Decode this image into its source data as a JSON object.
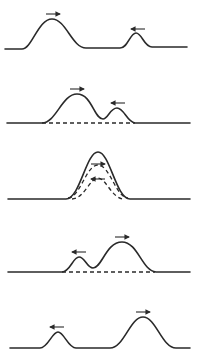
{
  "diagram": {
    "type": "wave-pulse-superposition",
    "colors": {
      "stroke": "#2a2a2a",
      "background": "#ffffff"
    },
    "panels": [
      {
        "name": "before-overlap",
        "baseline_y": 49,
        "pulses": [
          {
            "center_x": 52,
            "peak_y": 19,
            "half_width": 26,
            "direction": "right",
            "arrow_y": 14
          },
          {
            "center_x": 136,
            "peak_y": 33,
            "half_width": 15,
            "direction": "left",
            "arrow_y": 29
          }
        ],
        "dashed_components": false
      },
      {
        "name": "beginning-overlap",
        "baseline_y": 123,
        "pulses": [
          {
            "center_x": 77,
            "peak_y": 94,
            "direction": "right",
            "arrow_y": 89
          },
          {
            "center_x": 117,
            "peak_y": 108,
            "direction": "left",
            "arrow_y": 103
          }
        ],
        "dashed_components": true
      },
      {
        "name": "full-overlap",
        "baseline_y": 199,
        "pulses": [
          {
            "center_x": 98,
            "peak_y": 152,
            "direction": "none"
          }
        ],
        "components": [
          {
            "peak_y": 165,
            "direction": "right",
            "arrow_y": 164
          },
          {
            "peak_y": 178,
            "direction": "left",
            "arrow_y": 179
          }
        ],
        "dashed_components": true
      },
      {
        "name": "separating",
        "baseline_y": 272,
        "pulses": [
          {
            "center_x": 79,
            "peak_y": 257,
            "direction": "left",
            "arrow_y": 252
          },
          {
            "center_x": 122,
            "peak_y": 242,
            "direction": "right",
            "arrow_y": 237
          }
        ],
        "dashed_components": true
      },
      {
        "name": "after-passing",
        "baseline_y": 348,
        "pulses": [
          {
            "center_x": 58,
            "peak_y": 332,
            "direction": "left",
            "arrow_y": 327
          },
          {
            "center_x": 143,
            "peak_y": 317,
            "direction": "right",
            "arrow_y": 312
          }
        ],
        "dashed_components": false
      }
    ]
  }
}
